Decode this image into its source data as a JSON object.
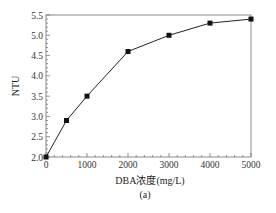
{
  "chart_data": {
    "type": "line",
    "title": "",
    "caption": "(a)",
    "xlabel": "DBA浓度(mg/L)",
    "ylabel": "NTU",
    "xlim": [
      0,
      5000
    ],
    "ylim": [
      2.0,
      5.5
    ],
    "x_ticks": [
      0,
      1000,
      2000,
      3000,
      4000,
      5000
    ],
    "y_ticks": [
      "2.0",
      "2.5",
      "3.0",
      "3.5",
      "4.0",
      "4.5",
      "5.0",
      "5.5"
    ],
    "grid": false,
    "legend": null,
    "series": [
      {
        "name": "NTU",
        "marker": "square",
        "color": "#111111",
        "x": [
          0,
          500,
          1000,
          2000,
          3000,
          4000,
          5000
        ],
        "y": [
          2.0,
          2.9,
          3.5,
          4.6,
          5.0,
          5.3,
          5.4
        ]
      }
    ]
  }
}
